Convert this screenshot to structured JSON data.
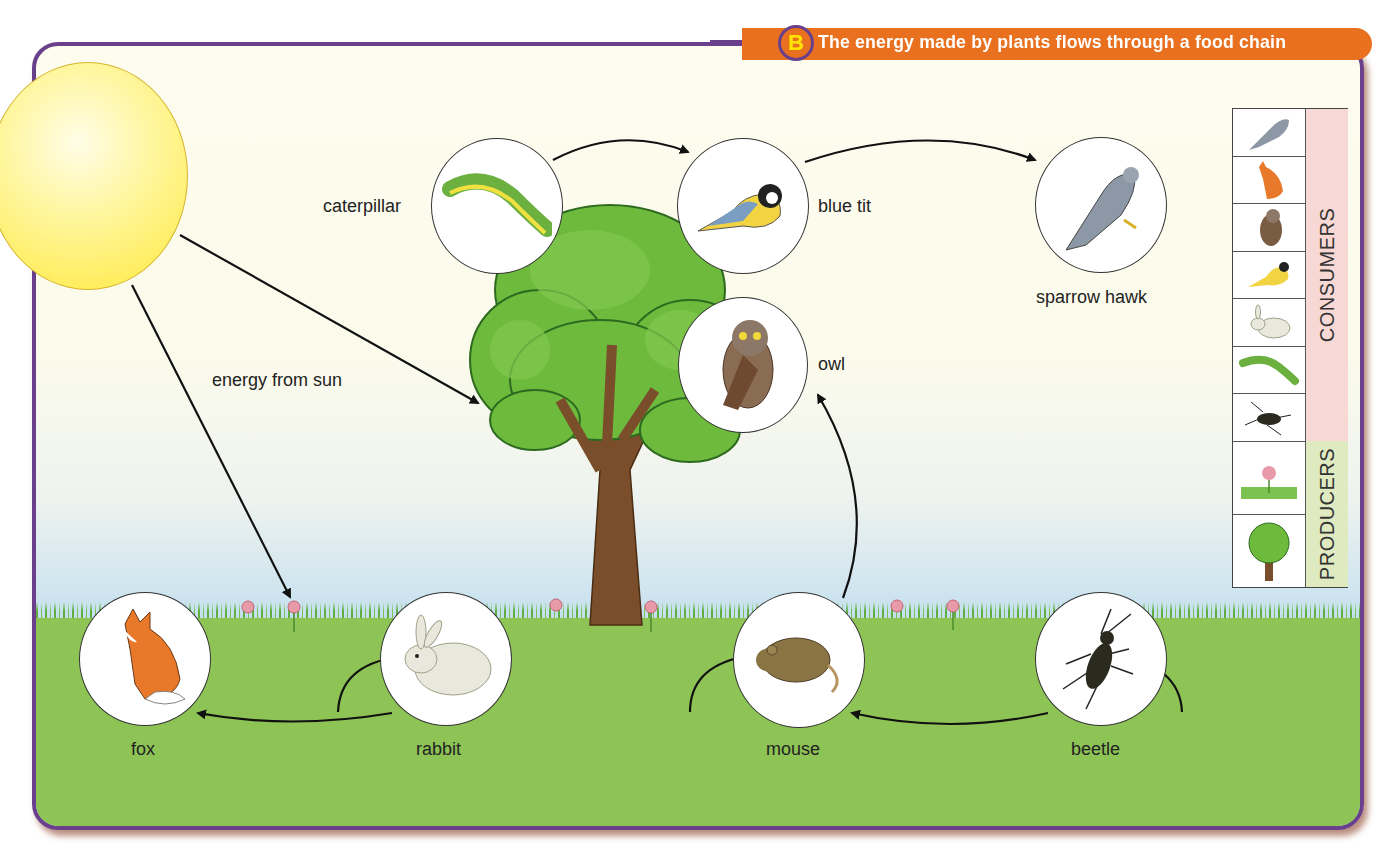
{
  "header": {
    "badge": "B",
    "title": "The energy made by plants flows through a food chain"
  },
  "labels": {
    "energy": "energy from sun",
    "caterpillar": "caterpillar",
    "blue_tit": "blue tit",
    "sparrow_hawk": "sparrow hawk",
    "owl": "owl",
    "fox": "fox",
    "rabbit": "rabbit",
    "mouse": "mouse",
    "beetle": "beetle"
  },
  "legend": {
    "consumers_label": "CONSUMERS",
    "producers_label": "PRODUCERS",
    "consumers": [
      "sparrow hawk",
      "fox",
      "owl",
      "blue tit",
      "rabbit",
      "caterpillar",
      "beetle"
    ],
    "producers": [
      "grass and flowers",
      "tree"
    ]
  },
  "food_chain_links": [
    {
      "from": "sun",
      "to": "tree"
    },
    {
      "from": "sun",
      "to": "flowers"
    },
    {
      "from": "caterpillar",
      "to": "blue tit"
    },
    {
      "from": "blue tit",
      "to": "sparrow hawk"
    },
    {
      "from": "mouse",
      "to": "owl"
    },
    {
      "from": "rabbit",
      "to": "fox"
    },
    {
      "from": "grass",
      "to": "rabbit"
    },
    {
      "from": "beetle",
      "to": "mouse"
    },
    {
      "from": "grass",
      "to": "mouse"
    },
    {
      "from": "grass",
      "to": "beetle"
    }
  ],
  "colors": {
    "frame": "#6a3f8c",
    "title_bar": "#e8701e",
    "badge_letter": "#ffe200",
    "grass": "#8dc455",
    "consumers_bg": "#f8d8d4",
    "producers_bg": "#dfeac0"
  }
}
